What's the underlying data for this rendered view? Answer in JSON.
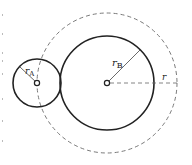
{
  "diagram": {
    "circle_a": {
      "label": "r",
      "subscript": "A",
      "cx": 37,
      "cy": 83,
      "radius": 24
    },
    "circle_b": {
      "label": "r",
      "subscript": "B",
      "cx": 107,
      "cy": 83,
      "radius": 47
    },
    "dashed_circle": {
      "label": "r",
      "cx": 107,
      "cy": 83,
      "radius": 71
    },
    "colors": {
      "stroke": "#222222",
      "dashed": "#7a7a7a",
      "background": "#ffffff"
    }
  }
}
